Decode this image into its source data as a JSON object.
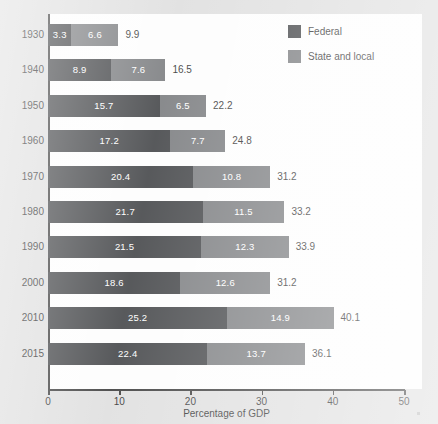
{
  "chart_data": {
    "type": "bar",
    "orientation": "horizontal",
    "stacked": true,
    "title": "",
    "xlabel": "Percentage of GDP",
    "ylabel": "",
    "xlim": [
      0,
      50
    ],
    "xticks": [
      "0",
      "10",
      "20",
      "30",
      "40",
      "50"
    ],
    "grid": false,
    "legend_position": "top-right",
    "categories": [
      "1930",
      "1940",
      "1950",
      "1960",
      "1970",
      "1980",
      "1990",
      "2000",
      "2010",
      "2015"
    ],
    "series": [
      {
        "name": "Federal",
        "color": "#333538",
        "values": [
          3.3,
          8.9,
          15.7,
          17.2,
          20.4,
          21.7,
          21.5,
          18.6,
          25.2,
          22.4
        ]
      },
      {
        "name": "State and local",
        "color": "#6f7174",
        "values": [
          6.6,
          7.6,
          6.5,
          7.7,
          10.8,
          11.5,
          12.3,
          12.6,
          14.9,
          13.7
        ]
      }
    ],
    "totals": [
      9.9,
      16.5,
      22.2,
      24.8,
      31.2,
      33.2,
      33.9,
      31.2,
      40.1,
      36.1
    ],
    "rows": [
      {
        "year": "1930",
        "federal": "3.3",
        "federal_value": 3.3,
        "state": "6.6",
        "state_value": 6.6,
        "total": "9.9",
        "total_value": 9.9
      },
      {
        "year": "1940",
        "federal": "8.9",
        "federal_value": 8.9,
        "state": "7.6",
        "state_value": 7.6,
        "total": "16.5",
        "total_value": 16.5
      },
      {
        "year": "1950",
        "federal": "15.7",
        "federal_value": 15.7,
        "state": "6.5",
        "state_value": 6.5,
        "total": "22.2",
        "total_value": 22.2
      },
      {
        "year": "1960",
        "federal": "17.2",
        "federal_value": 17.2,
        "state": "7.7",
        "state_value": 7.7,
        "total": "24.8",
        "total_value": 24.8
      },
      {
        "year": "1970",
        "federal": "20.4",
        "federal_value": 20.4,
        "state": "10.8",
        "state_value": 10.8,
        "total": "31.2",
        "total_value": 31.2
      },
      {
        "year": "1980",
        "federal": "21.7",
        "federal_value": 21.7,
        "state": "11.5",
        "state_value": 11.5,
        "total": "33.2",
        "total_value": 33.2
      },
      {
        "year": "1990",
        "federal": "21.5",
        "federal_value": 21.5,
        "state": "12.3",
        "state_value": 12.3,
        "total": "33.9",
        "total_value": 33.9
      },
      {
        "year": "2000",
        "federal": "18.6",
        "federal_value": 18.6,
        "state": "12.6",
        "state_value": 12.6,
        "total": "31.2",
        "total_value": 31.2
      },
      {
        "year": "2010",
        "federal": "25.2",
        "federal_value": 25.2,
        "state": "14.9",
        "state_value": 14.9,
        "total": "40.1",
        "total_value": 40.1
      },
      {
        "year": "2015",
        "federal": "22.4",
        "federal_value": 22.4,
        "state": "13.7",
        "state_value": 13.7,
        "total": "36.1",
        "total_value": 36.1
      }
    ]
  },
  "legend": {
    "items": [
      {
        "label": "Federal",
        "color": "#333538"
      },
      {
        "label": "State and local",
        "color": "#6f7174"
      }
    ]
  },
  "axis": {
    "x_title": "Percentage of GDP",
    "x_ticks": [
      "0",
      "10",
      "20",
      "30",
      "40",
      "50"
    ]
  },
  "colors": {
    "federal": "#333538",
    "state_and_local": "#6f7174",
    "page_background": "#dcdcdc",
    "plot_background": "#fdfdfd",
    "axis": "#2b2b2b",
    "text": "#1d1d1d",
    "bar_label_text": "#ffffff"
  }
}
